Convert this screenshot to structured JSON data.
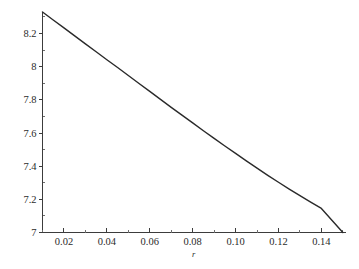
{
  "figure": {
    "background_color": "#ffffff",
    "curve_color": "#2a2a2a",
    "axis_color": "#3c3c3c",
    "text_color": "#2b2b2b"
  },
  "chart_data": {
    "type": "line",
    "title": "",
    "subtitle": "",
    "xlabel": "r",
    "ylabel": "",
    "xlim": [
      0.01,
      0.151
    ],
    "ylim": [
      7.0,
      8.33
    ],
    "grid": false,
    "legend": null,
    "x_tick_labels": [
      "0.02",
      "0.04",
      "0.06",
      "0.08",
      "0.10",
      "0.12",
      "0.14"
    ],
    "x_tick_values": [
      0.02,
      0.04,
      0.06,
      0.08,
      0.1,
      0.12,
      0.14
    ],
    "x_minor_tick_values": [
      0.01,
      0.03,
      0.05,
      0.07,
      0.09,
      0.11,
      0.13,
      0.15
    ],
    "y_tick_labels": [
      "7",
      "7.2",
      "7.4",
      "7.6",
      "7.8",
      "8",
      "8.2"
    ],
    "y_tick_values": [
      7.0,
      7.2,
      7.4,
      7.6,
      7.8,
      8.0,
      8.2
    ],
    "y_minor_tick_values": [
      7.1,
      7.3,
      7.5,
      7.7,
      7.9,
      8.1,
      8.3
    ],
    "series": [
      {
        "name": "curve",
        "x": [
          0.01,
          0.015,
          0.02,
          0.025,
          0.03,
          0.035,
          0.04,
          0.045,
          0.05,
          0.055,
          0.06,
          0.065,
          0.07,
          0.075,
          0.08,
          0.085,
          0.09,
          0.095,
          0.1,
          0.105,
          0.11,
          0.115,
          0.12,
          0.125,
          0.13,
          0.135,
          0.14,
          0.145,
          0.15
        ],
        "y": [
          8.33,
          8.282,
          8.234,
          8.186,
          8.138,
          8.09,
          8.042,
          7.995,
          7.947,
          7.899,
          7.851,
          7.803,
          7.755,
          7.708,
          7.661,
          7.614,
          7.568,
          7.522,
          7.477,
          7.432,
          7.388,
          7.345,
          7.303,
          7.262,
          7.222,
          7.183,
          7.145,
          7.072,
          7.0
        ]
      }
    ]
  }
}
